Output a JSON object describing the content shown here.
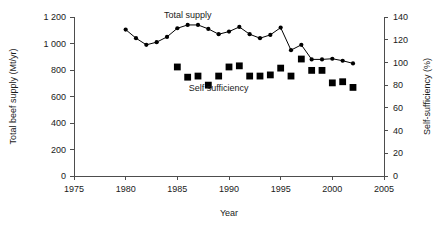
{
  "chart_data": {
    "type": "line",
    "title": "",
    "xlabel": "Year",
    "ylabel": "Total beef supply (Mt/yr)",
    "y2label": "Self-sufficiency (%)",
    "xlim": [
      1975,
      2005
    ],
    "ylim": [
      0,
      1200
    ],
    "y2lim": [
      0,
      140
    ],
    "xticks": [
      1975,
      1980,
      1985,
      1990,
      1995,
      2000,
      2005
    ],
    "xticklabels": [
      "1975",
      "1980",
      "1985",
      "1990",
      "1995",
      "2000",
      "2005"
    ],
    "yticks": [
      0,
      200,
      400,
      600,
      800,
      1000,
      1200
    ],
    "yticklabels": [
      "0",
      "200",
      "400",
      "600",
      "800",
      "1 000",
      "1 200"
    ],
    "y2ticks": [
      0,
      20,
      40,
      60,
      80,
      100,
      120,
      140
    ],
    "y2ticklabels": [
      "0",
      "20",
      "40",
      "60",
      "80",
      "100",
      "120",
      "140"
    ],
    "grid": false,
    "legend_position": "inline-annotations",
    "series": [
      {
        "name": "Total supply",
        "label": "Total supply",
        "marker": "circle",
        "line": true,
        "axis": "left",
        "units": "Mt/yr",
        "x": [
          1980,
          1981,
          1982,
          1983,
          1984,
          1985,
          1986,
          1987,
          1988,
          1989,
          1990,
          1991,
          1992,
          1993,
          1994,
          1995,
          1996,
          1997,
          1998,
          1999,
          2000,
          2001,
          2002
        ],
        "values": [
          1105,
          1040,
          990,
          1010,
          1050,
          1115,
          1140,
          1140,
          1110,
          1070,
          1090,
          1125,
          1070,
          1040,
          1065,
          1120,
          950,
          990,
          880,
          880,
          885,
          870,
          850
        ]
      },
      {
        "name": "Self sufficiency",
        "label": "Self sufficiency",
        "marker": "square",
        "line": false,
        "axis": "right",
        "units": "%",
        "x": [
          1985,
          1986,
          1987,
          1988,
          1989,
          1990,
          1991,
          1992,
          1993,
          1994,
          1995,
          1996,
          1997,
          1998,
          1999,
          2000,
          2001,
          2002
        ],
        "values": [
          96,
          87,
          88,
          80,
          88,
          96,
          97,
          88,
          88,
          89,
          95,
          88,
          103,
          93,
          93,
          82,
          83,
          78
        ]
      }
    ],
    "annotations": [
      {
        "text": "Total supply",
        "x": 1986,
        "y": 1190
      },
      {
        "text": "Self sufficiency",
        "x": 1989,
        "y": 640
      }
    ]
  }
}
